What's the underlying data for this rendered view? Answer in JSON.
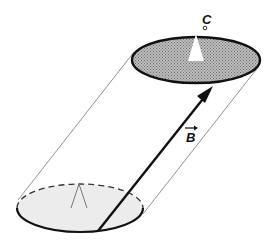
{
  "diagram": {
    "type": "flux-tube / oblique cylinder",
    "labels": {
      "vector": "B",
      "curve": "C"
    },
    "colors": {
      "top_surface_fill": "#a8a8a8",
      "bottom_surface_fill": "#ececec",
      "stroke": "#111111",
      "guide_line": "#777777"
    },
    "elements": [
      {
        "id": "top-ellipse",
        "description": "shaded ellipse at top with closed curve C"
      },
      {
        "id": "bottom-ellipse",
        "description": "lightly shaded ellipse at bottom, back half dashed"
      },
      {
        "id": "vector-B",
        "description": "arrow from bottom ellipse rim to top ellipse rim"
      },
      {
        "id": "side-lines",
        "description": "thin tangent lines connecting the two ellipses"
      },
      {
        "id": "top-marker",
        "description": "white triangular notch on top ellipse"
      },
      {
        "id": "bottom-marker",
        "description": "outline triangular notch on bottom ellipse"
      }
    ]
  }
}
